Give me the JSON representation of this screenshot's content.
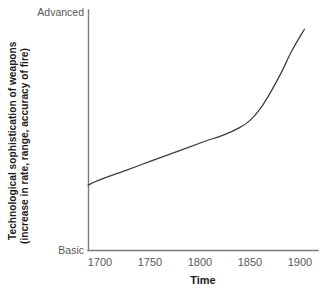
{
  "chart_data": {
    "type": "line",
    "title": "",
    "xlabel": "Time",
    "ylabel": "Technological sophistication of weapons (increase in rate, range, accuracy of fire)",
    "ylabel_line1": "Technological sophistication of weapons",
    "ylabel_line2": "(increase in rate, range, accuracy of fire)",
    "x_tick_labels": [
      "1700",
      "1750",
      "1800",
      "1850",
      "1900"
    ],
    "x_ticks": [
      1700,
      1750,
      1800,
      1850,
      1900
    ],
    "xlim": [
      1690,
      1910
    ],
    "y_tick_labels": [
      "Basic",
      "Advanced"
    ],
    "ylim": [
      0,
      100
    ],
    "y_axis_min_label": "Basic",
    "y_axis_max_label": "Advanced",
    "grid": false,
    "legend": false,
    "legend_position": "none",
    "series": [
      {
        "name": "Technological sophistication of weapons",
        "color": "#3c3c3c",
        "x": [
          1690,
          1700,
          1725,
          1750,
          1775,
          1800,
          1820,
          1835,
          1845,
          1855,
          1865,
          1875,
          1885,
          1897
        ],
        "values": [
          27,
          29,
          33,
          37,
          41,
          45,
          48,
          51,
          54,
          59,
          66,
          74,
          83,
          92
        ]
      }
    ]
  },
  "colors": {
    "background": "#ffffff",
    "axis": "#7d7d7d",
    "curve": "#3c3c3c",
    "tick_text": "#58585a",
    "title_text": "#1c1c1c"
  }
}
